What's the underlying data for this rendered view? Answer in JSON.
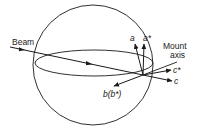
{
  "diagram": {
    "type": "crystal-orientation-sphere",
    "labels": {
      "beam": "Beam",
      "mount_axis_line1": "Mount",
      "mount_axis_line2": "axis",
      "a": "a",
      "a_star": "a*",
      "c_star": "c*",
      "c": "c",
      "b_bstar": "b(b*)"
    },
    "colors": {
      "stroke": "#1a1a1a",
      "background": "#ffffff"
    }
  }
}
